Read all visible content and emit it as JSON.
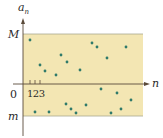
{
  "diagram": {
    "labels": {
      "y_axis": "a",
      "y_axis_sub": "n",
      "x_axis": "n",
      "upper_bound": "M",
      "lower_bound": "m",
      "origin": "0",
      "ticks": "123"
    },
    "colors": {
      "band": "#f3e6b3",
      "band_edge": "#a8a890",
      "axis": "#5a4a3a",
      "dots": "#2f7a6a"
    },
    "points": [
      [
        30,
        40
      ],
      [
        40,
        65
      ],
      [
        45,
        71
      ],
      [
        56,
        75
      ],
      [
        61,
        55
      ],
      [
        67,
        62
      ],
      [
        80,
        70
      ],
      [
        92,
        43
      ],
      [
        97,
        47
      ],
      [
        107,
        58
      ],
      [
        126,
        47
      ],
      [
        101,
        89
      ],
      [
        117,
        93
      ],
      [
        131,
        100
      ],
      [
        35,
        112
      ],
      [
        49,
        112
      ],
      [
        66,
        104
      ],
      [
        71,
        109
      ],
      [
        76,
        113
      ],
      [
        86,
        105
      ],
      [
        111,
        113
      ],
      [
        121,
        109
      ]
    ]
  }
}
